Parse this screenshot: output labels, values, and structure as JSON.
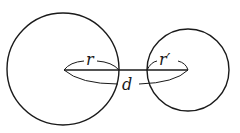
{
  "diagram": {
    "title": "",
    "stroke_color": "#1a1a1a",
    "background": "#ffffff",
    "circles": [
      {
        "name": "large-circle",
        "cx": 63,
        "cy": 69,
        "r": 56
      },
      {
        "name": "small-circle",
        "cx": 188,
        "cy": 70,
        "r": 41
      }
    ],
    "labels": {
      "radius_large": "r",
      "radius_small": "r′",
      "distance": "d"
    }
  }
}
